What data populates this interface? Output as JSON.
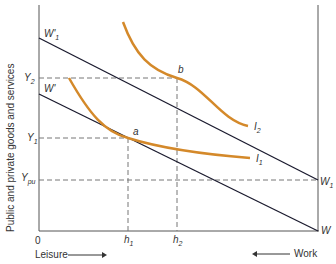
{
  "diagram": {
    "y_axis_label": "Public and private goods and services",
    "x_axis_left_label": "Leisure",
    "x_axis_right_label": "Work",
    "origin": "0",
    "budget_lines": [
      {
        "start_label": "W'",
        "start_sub": "",
        "end_label": "W",
        "end_sub": ""
      },
      {
        "start_label": "W'",
        "start_sub": "1",
        "end_label": "W",
        "end_sub": "1"
      }
    ],
    "y_ticks": [
      {
        "label": "Y",
        "sub": "2"
      },
      {
        "label": "Y",
        "sub": "1"
      },
      {
        "label": "Y",
        "sub": "pu"
      }
    ],
    "x_ticks": [
      {
        "label": "h",
        "sub": "1"
      },
      {
        "label": "h",
        "sub": "2"
      }
    ],
    "points": [
      {
        "label": "a"
      },
      {
        "label": "b"
      }
    ],
    "curves": [
      {
        "label": "I",
        "sub": "1"
      },
      {
        "label": "I",
        "sub": "2"
      }
    ],
    "colors": {
      "axis": "#555555",
      "budget_line": "#1a1a2e",
      "indifference_curve": "#d4892a",
      "dashed": "#777777"
    }
  }
}
